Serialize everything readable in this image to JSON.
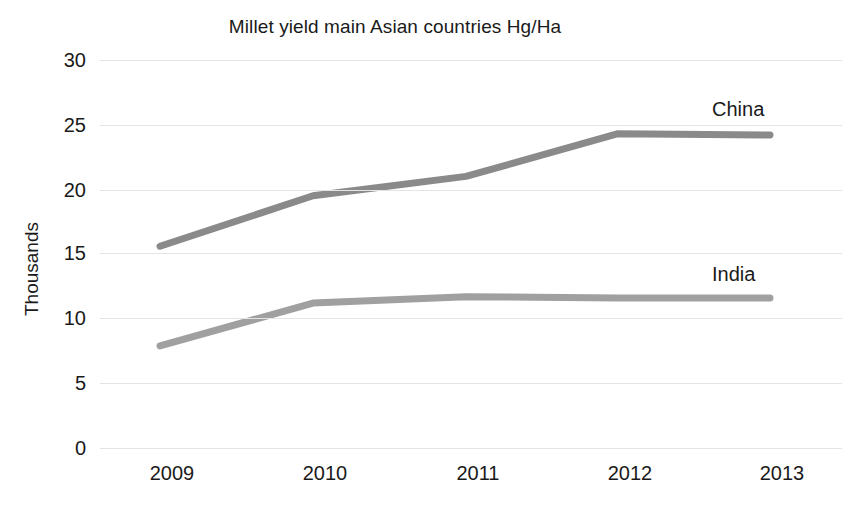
{
  "chart_data": {
    "type": "line",
    "title": "Millet yield main Asian countries Hg/Ha",
    "xlabel": "",
    "ylabel": "Thousands",
    "x": [
      "2009",
      "2010",
      "2011",
      "2012",
      "2013"
    ],
    "categories": [
      "2009",
      "2010",
      "2011",
      "2012",
      "2013"
    ],
    "series": [
      {
        "name": "China",
        "values": [
          15.6,
          19.5,
          21.0,
          24.3,
          24.2
        ],
        "color": "#8a8a8a"
      },
      {
        "name": "India",
        "values": [
          7.9,
          11.2,
          11.7,
          11.6,
          11.6
        ],
        "color": "#a0a0a0"
      }
    ],
    "ylim": [
      0,
      30
    ],
    "y_ticks": [
      0,
      5,
      10,
      15,
      20,
      25,
      30
    ],
    "y_tick_labels": [
      "0",
      "5",
      "10",
      "15",
      "20",
      "25",
      "30"
    ],
    "grid": "horizontal",
    "legend_position": "inline-end-labels",
    "markers": false,
    "background": "#ffffff",
    "gridline_color": "#e4e4e4"
  }
}
